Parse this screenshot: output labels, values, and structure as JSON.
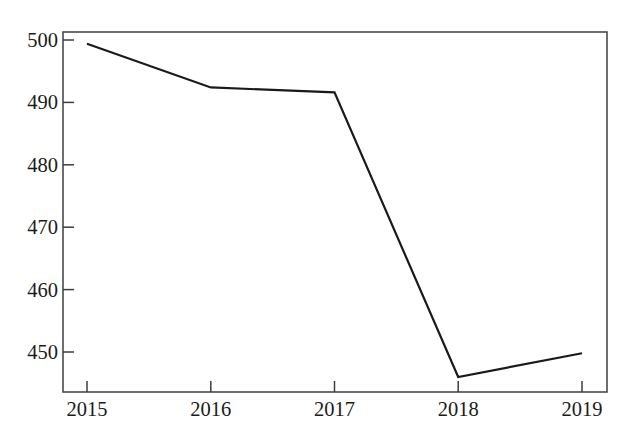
{
  "chart_data": {
    "type": "line",
    "title": "",
    "subtitle": "",
    "xlabel": "",
    "ylabel": "",
    "categories": [
      "2015",
      "2016",
      "2017",
      "2018",
      "2019"
    ],
    "x": [
      2015,
      2016,
      2017,
      2018,
      2019
    ],
    "values": [
      499.4,
      492.4,
      491.6,
      446.0,
      449.8
    ],
    "series": [
      {
        "name": "",
        "values": [
          499.4,
          492.4,
          491.6,
          446.0,
          449.8
        ]
      }
    ],
    "ylim": [
      443.5,
      501.3
    ],
    "xlim": [
      2014.8,
      2019.2
    ],
    "yticks": [
      450,
      460,
      470,
      480,
      490,
      500
    ],
    "ytick_labels": [
      "450",
      "460",
      "470",
      "480",
      "490",
      "500"
    ],
    "xticks": [
      2015,
      2016,
      2017,
      2018,
      2019
    ],
    "xtick_labels": [
      "2015",
      "2016",
      "2017",
      "2018",
      "2019"
    ],
    "grid": false,
    "legend": false,
    "legend_position": "none",
    "markers": false,
    "line_color": "#1a1a1a",
    "line_width": 2.2,
    "frame_color": "#4a4a4a",
    "background_color": "#ffffff",
    "text_color": "#1b1b1b",
    "annotations": []
  },
  "axes": {
    "y_labels": [
      {
        "text": "500",
        "y": 40
      },
      {
        "text": "490",
        "y": 102.4
      },
      {
        "text": "480",
        "y": 164.8
      },
      {
        "text": "470",
        "y": 227.2
      },
      {
        "text": "460",
        "y": 289.6
      },
      {
        "text": "450",
        "y": 352
      }
    ],
    "x_labels": [
      {
        "text": "2015",
        "x": 87
      },
      {
        "text": "2016",
        "x": 210.8
      },
      {
        "text": "2017",
        "x": 334.5
      },
      {
        "text": "2018",
        "x": 458.2
      },
      {
        "text": "2019",
        "x": 582
      }
    ]
  }
}
